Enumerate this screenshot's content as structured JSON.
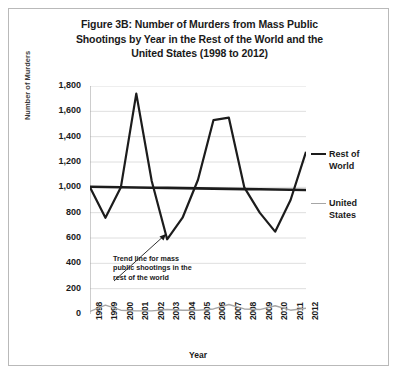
{
  "figure": {
    "title_lines": [
      "Figure 3B: Number of Murders from Mass Public",
      "Shootings by Year in the Rest of the World and the",
      "United States (1998 to 2012)"
    ],
    "annotation_lines": [
      "Trend line for mass",
      "public shootings in the",
      "rest of the world"
    ],
    "annotation_full": "Trend line for mass public shootings in the rest of the world",
    "border_color": "#b9b9b9",
    "background": "#ffffff"
  },
  "legend": {
    "position": "right",
    "items": [
      {
        "label_line1": "Rest of",
        "label_line2": "World",
        "label": "Rest of World",
        "color": "#1c1c1c",
        "weight": "thick"
      },
      {
        "label_line1": "United",
        "label_line2": "States",
        "label": "United States",
        "color": "#a6a6a6",
        "weight": "thin"
      }
    ]
  },
  "chart_data": {
    "type": "line",
    "title": "Figure 3B: Number of Murders from Mass Public Shootings by Year in the Rest of the World and the United States (1998 to 2012)",
    "xlabel": "Year",
    "ylabel": "Number of Murders",
    "categories": [
      "1998",
      "1999",
      "2000",
      "2001",
      "2002",
      "2003",
      "2004",
      "2005",
      "2006",
      "2007",
      "2008",
      "2009",
      "2010",
      "2011",
      "2012"
    ],
    "tick_labels_y": [
      "0",
      "200",
      "400",
      "600",
      "800",
      "1,000",
      "1,200",
      "1,400",
      "1,600",
      "1,800"
    ],
    "ylim": [
      0,
      1800
    ],
    "ytick_step": 200,
    "grid": true,
    "legend_position": "right",
    "series": [
      {
        "name": "Rest of World",
        "color": "#1c1c1c",
        "values": [
          1000,
          760,
          1000,
          1740,
          1050,
          590,
          760,
          1060,
          1530,
          1550,
          1000,
          800,
          650,
          900,
          1280
        ]
      },
      {
        "name": "United States",
        "color": "#a6a6a6",
        "values": [
          20,
          70,
          30,
          25,
          25,
          35,
          30,
          30,
          40,
          75,
          40,
          35,
          65,
          30,
          45
        ]
      },
      {
        "name": "Trend line",
        "color": "#1c1c1c",
        "annotation": "Trend line for mass public shootings in the rest of the world",
        "values": [
          1005,
          1003,
          1001,
          999,
          997,
          996,
          994,
          992,
          990,
          988,
          986,
          985,
          983,
          981,
          979
        ]
      }
    ]
  }
}
